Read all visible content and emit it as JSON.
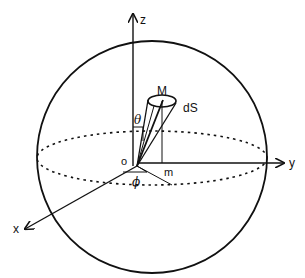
{
  "diagram": {
    "type": "spherical-coordinates",
    "labels": {
      "z_axis": "z",
      "y_axis": "y",
      "x_axis": "x",
      "origin": "o",
      "point_M": "M",
      "surface_element": "dS",
      "projection_m": "m",
      "theta": "θ",
      "phi": "ϕ"
    },
    "colors": {
      "stroke": "#111111",
      "background": "#ffffff"
    }
  }
}
